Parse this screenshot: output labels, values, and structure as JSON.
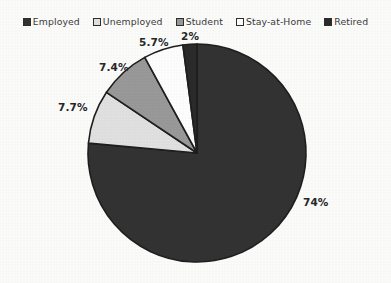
{
  "chart_data": {
    "type": "pie",
    "title": "",
    "legend_position": "top",
    "labels": [
      "Employed",
      "Unemployed",
      "Student",
      "Stay-at-Home",
      "Retired"
    ],
    "values": [
      74,
      7.7,
      7.4,
      5.7,
      2
    ],
    "data_labels": [
      "74%",
      "7.7%",
      "7.4%",
      "5.7%",
      "2%"
    ],
    "colors": [
      "#333333",
      "#e2e2e2",
      "#9a9a9a",
      "#ffffff",
      "#2b2b2b"
    ],
    "slice_order_clockwise_from_top": [
      "Employed",
      "Unemployed",
      "Student",
      "Stay-at-Home",
      "Retired"
    ],
    "start_angle_deg": 0,
    "stroke_color": "#1f1f1f"
  },
  "legend": {
    "entries": [
      {
        "label": "Employed",
        "color": "#333333",
        "value": "74%"
      },
      {
        "label": "Unemployed",
        "color": "#e2e2e2",
        "value": "7.7%"
      },
      {
        "label": "Student",
        "color": "#9a9a9a",
        "value": "7.4%"
      },
      {
        "label": "Stay-at-Home",
        "color": "#ffffff",
        "value": "5.7%"
      },
      {
        "label": "Retired",
        "color": "#2b2b2b",
        "value": "2%"
      }
    ]
  },
  "labels": {
    "employed": "74%",
    "unemployed": "7.7%",
    "student": "7.4%",
    "stay_at_home": "5.7%",
    "retired": "2%"
  }
}
